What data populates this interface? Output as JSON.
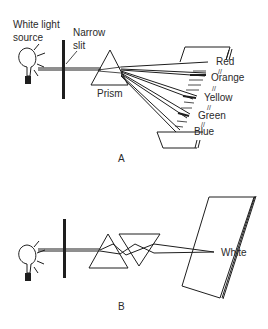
{
  "diagram": {
    "panel_a": {
      "caption": "A",
      "labels": {
        "source_line1": "White light",
        "source_line2": "source",
        "slit_line1": "Narrow",
        "slit_line2": "slit",
        "prism": "Prism"
      },
      "spectrum": [
        {
          "label": "Red",
          "separator": "//"
        },
        {
          "label": "Orange",
          "separator": "//"
        },
        {
          "label": "Yellow",
          "separator": "//"
        },
        {
          "label": "Green",
          "separator": "//"
        },
        {
          "label": "Blue",
          "separator": ""
        }
      ]
    },
    "panel_b": {
      "caption": "B",
      "labels": {
        "result": "White"
      }
    }
  }
}
